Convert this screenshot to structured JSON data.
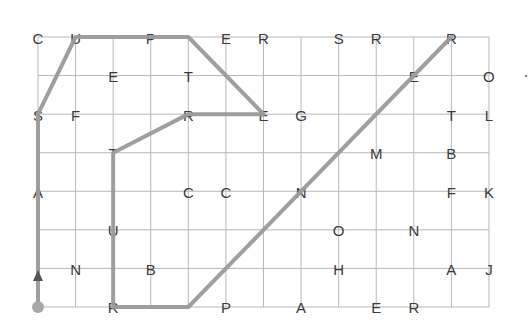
{
  "grid": {
    "cols": 13,
    "rows": 8,
    "origin_x": 38,
    "origin_y": 37,
    "step_x": 37.58,
    "step_y": 38.57,
    "line_color": "#b8b8b8",
    "path_color": "#9a9a9a",
    "letter_color": "#3a3a3a"
  },
  "letters": [
    {
      "ch": "C",
      "c": 0,
      "r": 0
    },
    {
      "ch": "U",
      "c": 1,
      "r": 0
    },
    {
      "ch": "P",
      "c": 3,
      "r": 0
    },
    {
      "ch": "E",
      "c": 5,
      "r": 0
    },
    {
      "ch": "R",
      "c": 6,
      "r": 0
    },
    {
      "ch": "S",
      "c": 8,
      "r": 0
    },
    {
      "ch": "R",
      "c": 9,
      "r": 0
    },
    {
      "ch": "R",
      "c": 11,
      "r": 0
    },
    {
      "ch": "E",
      "c": 2,
      "r": 1
    },
    {
      "ch": "T",
      "c": 4,
      "r": 1
    },
    {
      "ch": "E",
      "c": 10,
      "r": 1
    },
    {
      "ch": "O",
      "c": 12,
      "r": 1
    },
    {
      "ch": "S",
      "c": 0,
      "r": 2
    },
    {
      "ch": "F",
      "c": 1,
      "r": 2
    },
    {
      "ch": "R",
      "c": 4,
      "r": 2
    },
    {
      "ch": "E",
      "c": 6,
      "r": 2
    },
    {
      "ch": "G",
      "c": 7,
      "r": 2
    },
    {
      "ch": "T",
      "c": 11,
      "r": 2
    },
    {
      "ch": "L",
      "c": 12,
      "r": 2
    },
    {
      "ch": "T",
      "c": 2,
      "r": 3
    },
    {
      "ch": "M",
      "c": 9,
      "r": 3
    },
    {
      "ch": "B",
      "c": 11,
      "r": 3
    },
    {
      "ch": "A",
      "c": 0,
      "r": 4
    },
    {
      "ch": "C",
      "c": 4,
      "r": 4
    },
    {
      "ch": "C",
      "c": 5,
      "r": 4
    },
    {
      "ch": "N",
      "c": 7,
      "r": 4
    },
    {
      "ch": "F",
      "c": 11,
      "r": 4
    },
    {
      "ch": "K",
      "c": 12,
      "r": 4
    },
    {
      "ch": "U",
      "c": 2,
      "r": 5
    },
    {
      "ch": "O",
      "c": 8,
      "r": 5
    },
    {
      "ch": "N",
      "c": 10,
      "r": 5
    },
    {
      "ch": "N",
      "c": 1,
      "r": 6
    },
    {
      "ch": "B",
      "c": 3,
      "r": 6
    },
    {
      "ch": "H",
      "c": 8,
      "r": 6
    },
    {
      "ch": "A",
      "c": 11,
      "r": 6
    },
    {
      "ch": "J",
      "c": 12,
      "r": 6
    },
    {
      "ch": "R",
      "c": 2,
      "r": 7
    },
    {
      "ch": "P",
      "c": 5,
      "r": 7
    },
    {
      "ch": "A",
      "c": 7,
      "r": 7
    },
    {
      "ch": "E",
      "c": 9,
      "r": 7
    },
    {
      "ch": "R",
      "c": 10,
      "r": 7
    }
  ],
  "path": [
    [
      0,
      7
    ],
    [
      0,
      2
    ],
    [
      1,
      0
    ],
    [
      4,
      0
    ],
    [
      6,
      2
    ],
    [
      4,
      2
    ],
    [
      2,
      3
    ],
    [
      2,
      7
    ],
    [
      4,
      7
    ],
    [
      11,
      0
    ]
  ],
  "start_marker": {
    "c": 0,
    "r": 7
  },
  "stray_dot": {
    "x": 526,
    "y": 76
  }
}
